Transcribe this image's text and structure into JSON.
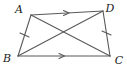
{
  "figure": {
    "shape": "trapezoid",
    "background_color": "#ffffff",
    "stroke_color": "#595959",
    "label_color": "#1a1a1a",
    "vertices": [
      {
        "name": "A",
        "label": "A",
        "x": 31,
        "y": 15,
        "label_x": 19,
        "label_y": 13
      },
      {
        "name": "D",
        "label": "D",
        "x": 103,
        "y": 11,
        "label_x": 108,
        "label_y": 12
      },
      {
        "name": "B",
        "label": "B",
        "x": 18,
        "y": 56,
        "label_x": 6,
        "label_y": 60
      },
      {
        "name": "C",
        "label": "C",
        "x": 110,
        "y": 56,
        "label_x": 113,
        "label_y": 62
      }
    ],
    "sides": [
      {
        "name": "side-AD",
        "from": "A",
        "to": "D",
        "marker": "single-arrow",
        "note": "parallel"
      },
      {
        "name": "side-BC",
        "from": "B",
        "to": "C",
        "marker": "single-arrow",
        "note": "parallel"
      },
      {
        "name": "side-AB",
        "from": "A",
        "to": "B",
        "marker": "single-tick",
        "note": "congruent"
      },
      {
        "name": "side-DC",
        "from": "D",
        "to": "C",
        "marker": "single-tick",
        "note": "congruent"
      }
    ],
    "diagonals": [
      {
        "name": "diagonal-AC",
        "from": "A",
        "to": "C"
      },
      {
        "name": "diagonal-BD",
        "from": "B",
        "to": "D"
      }
    ]
  }
}
